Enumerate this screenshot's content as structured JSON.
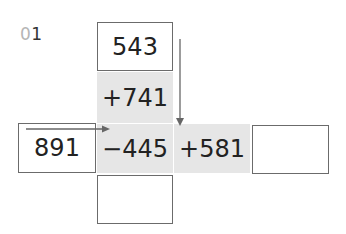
{
  "problem": {
    "number_prefix": "0",
    "number_suffix": "1"
  },
  "grid": {
    "top": "543",
    "op_top": "+741",
    "left": "891",
    "op_center": "−445",
    "op_right": "+581",
    "right_answer": "",
    "bottom_answer": ""
  }
}
